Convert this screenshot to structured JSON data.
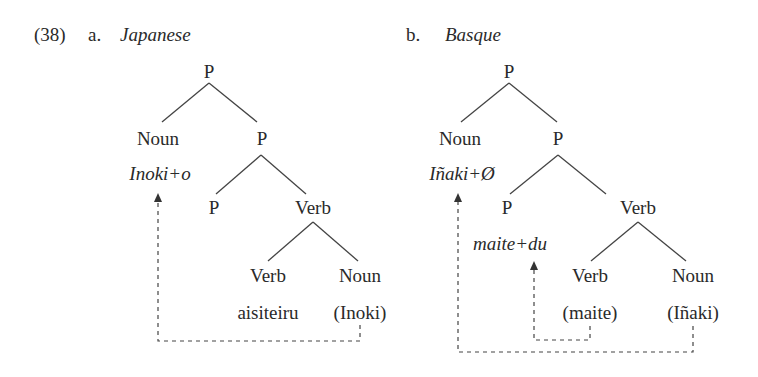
{
  "example_number": "(38)",
  "trees": [
    {
      "label": "a.",
      "language": "Japanese",
      "nodes": {
        "root": "P",
        "noun": "Noun",
        "noun_form": "Inoki+o",
        "p2": "P",
        "p3": "P",
        "verb": "Verb",
        "verb2": "Verb",
        "verb2_form": "aisiteiru",
        "noun2": "Noun",
        "noun2_form": "(Inoki)"
      }
    },
    {
      "label": "b.",
      "language": "Basque",
      "nodes": {
        "root": "P",
        "noun": "Noun",
        "noun_form": "Iñaki+Ø",
        "p2": "P",
        "p3": "P",
        "p3_form": "maite+du",
        "verb": "Verb",
        "verb2": "Verb",
        "verb2_form": "(maite)",
        "noun2": "Noun",
        "noun2_form": "(Iñaki)"
      }
    }
  ]
}
